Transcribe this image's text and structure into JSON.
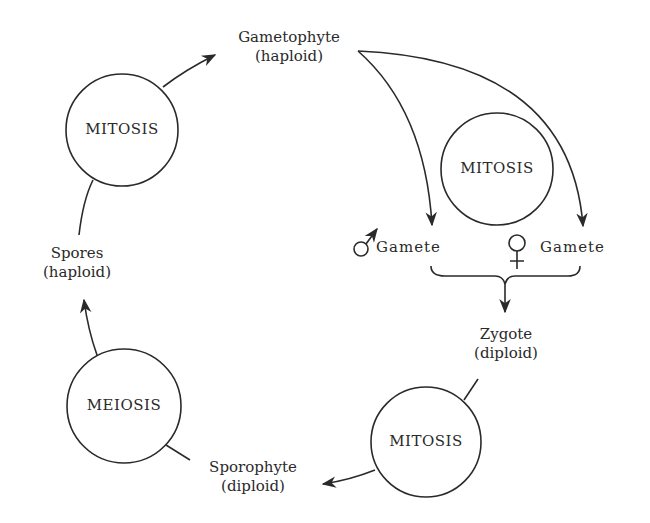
{
  "diagram": {
    "type": "life-cycle",
    "stages": {
      "gametophyte": {
        "name": "Gametophyte",
        "ploidy": "(haploid)"
      },
      "spores": {
        "name": "Spores",
        "ploidy": "(haploid)"
      },
      "zygote": {
        "name": "Zygote",
        "ploidy": "(diploid)"
      },
      "sporophyte": {
        "name": "Sporophyte",
        "ploidy": "(diploid)"
      },
      "male_gamete": {
        "symbol": "male-symbol",
        "label": "Gamete"
      },
      "female_gamete": {
        "symbol": "female-symbol",
        "label": "Gamete"
      }
    },
    "processes": {
      "mitosis_top_left": "MITOSIS",
      "mitosis_center": "MITOSIS",
      "mitosis_bottom_right": "MITOSIS",
      "meiosis": "MEIOSIS"
    },
    "colors": {
      "line": "#2a2a2a",
      "background": "#ffffff"
    }
  }
}
